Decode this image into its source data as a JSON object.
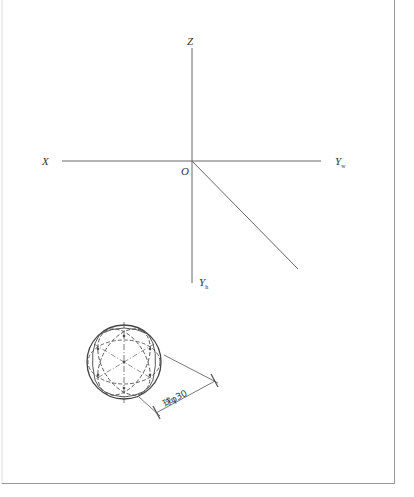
{
  "diagram": {
    "type": "orthographic-projection-axes",
    "axes": {
      "z_label": "Z",
      "x_label": "X",
      "origin_label": "O",
      "yw_label": "Y",
      "yw_sub": "w",
      "yh_label": "Y",
      "yh_sub": "h"
    },
    "sphere": {
      "description": "Axonometric sphere with dashed great circles",
      "dimension_text": "球φ30"
    },
    "colors": {
      "line": "#555555",
      "frame": "#999999",
      "background": "#ffffff"
    }
  }
}
